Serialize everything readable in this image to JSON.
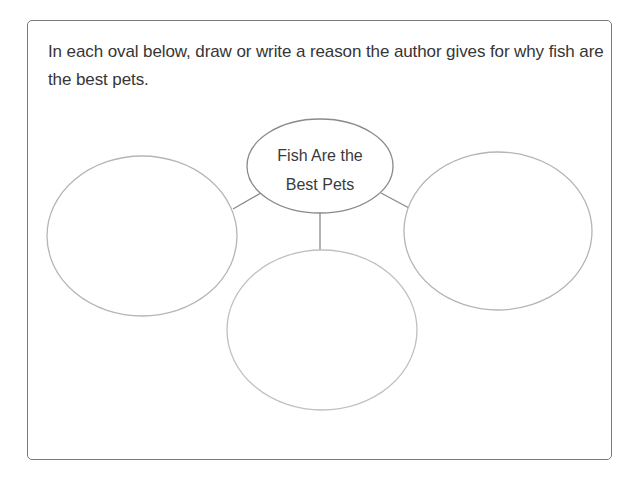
{
  "worksheet": {
    "prompt": "In each oval below, draw or write a reason the author gives for why fish are the best pets.",
    "center_oval": {
      "line1": "Fish Are the",
      "line2": "Best Pets"
    },
    "answer_ovals": [
      {
        "position": "left",
        "content": ""
      },
      {
        "position": "bottom",
        "content": ""
      },
      {
        "position": "right",
        "content": ""
      }
    ],
    "colors": {
      "text": "#363636",
      "frame_border": "#7a7a7a",
      "center_oval_stroke": "#8a8a8a",
      "answer_oval_stroke": "#b5b5b5",
      "connector": "#8a8a8a"
    }
  }
}
